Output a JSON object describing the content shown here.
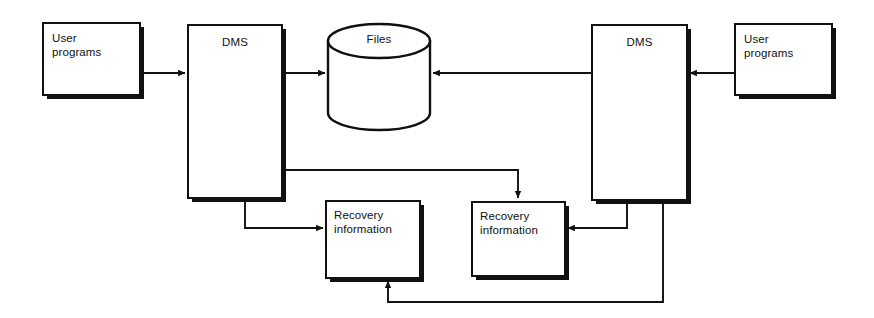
{
  "diagram": {
    "canvas": {
      "width": 874,
      "height": 318
    },
    "colors": {
      "background": "#ffffff",
      "stroke": "#111111",
      "text": "#111111",
      "shadow": "#111111"
    },
    "nodes": [
      {
        "id": "user-programs-left",
        "label": "User\nprograms",
        "shape": "rect",
        "x": 43,
        "y": 23,
        "w": 97,
        "h": 72,
        "text_align": "left"
      },
      {
        "id": "dms-left",
        "label": "DMS",
        "shape": "rect",
        "x": 188,
        "y": 25,
        "w": 94,
        "h": 173,
        "text_align": "center"
      },
      {
        "id": "files",
        "label": "Files",
        "shape": "cylinder",
        "x": 328,
        "y": 24,
        "w": 102,
        "h": 106,
        "text_align": "center"
      },
      {
        "id": "dms-right",
        "label": "DMS",
        "shape": "rect",
        "x": 592,
        "y": 25,
        "w": 95,
        "h": 175,
        "text_align": "center"
      },
      {
        "id": "user-programs-right",
        "label": "User\nprograms",
        "shape": "rect",
        "x": 735,
        "y": 24,
        "w": 97,
        "h": 71,
        "text_align": "left"
      },
      {
        "id": "recovery-information-left",
        "label": "Recovery\ninformation",
        "shape": "rect",
        "x": 326,
        "y": 201,
        "w": 94,
        "h": 77,
        "text_align": "left"
      },
      {
        "id": "recovery-information-right",
        "label": "Recovery\ninformation",
        "shape": "rect",
        "x": 472,
        "y": 202,
        "w": 93,
        "h": 74,
        "text_align": "left"
      }
    ],
    "connections": [
      {
        "id": "user-programs-left-to-dms-left",
        "from": "user-programs-left",
        "to": "dms-left",
        "arrow": "end"
      },
      {
        "id": "dms-left-to-files",
        "from": "dms-left",
        "to": "files",
        "arrow": "end"
      },
      {
        "id": "dms-right-to-files",
        "from": "dms-right",
        "to": "files",
        "arrow": "end"
      },
      {
        "id": "user-programs-right-to-dms-right",
        "from": "user-programs-right",
        "to": "dms-right",
        "arrow": "end"
      },
      {
        "id": "dms-left-to-recovery-information-left",
        "from": "dms-left",
        "to": "recovery-information-left",
        "arrow": "end"
      },
      {
        "id": "dms-left-to-recovery-information-right",
        "from": "dms-left",
        "to": "recovery-information-right",
        "arrow": "end"
      },
      {
        "id": "dms-right-to-recovery-information-right",
        "from": "dms-right",
        "to": "recovery-information-right",
        "arrow": "end"
      },
      {
        "id": "dms-right-to-recovery-information-left",
        "from": "dms-right",
        "to": "recovery-information-left",
        "arrow": "end"
      }
    ]
  }
}
